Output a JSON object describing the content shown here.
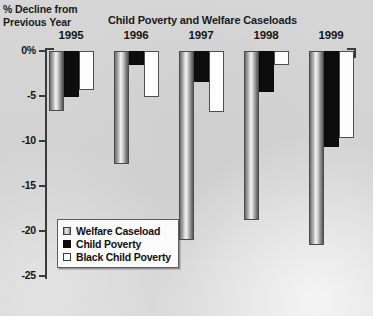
{
  "chart_data": {
    "type": "bar",
    "title": "Child Poverty and Welfare Caseloads",
    "ylabel": "% Decline from Previous Year",
    "xlabel": "",
    "categories": [
      "1995",
      "1996",
      "1997",
      "1998",
      "1999"
    ],
    "ylim": [
      -25,
      0
    ],
    "ytick_labels": [
      "0%",
      "-5",
      "-10",
      "-15",
      "-20",
      "-25"
    ],
    "ytick_values": [
      0,
      -5,
      -10,
      -15,
      -20,
      -25
    ],
    "grid": false,
    "legend_position": "inside-lower-left",
    "series": [
      {
        "name": "Welfare Caseload",
        "color": "#b0b0b0",
        "fill": "gradient-gray",
        "values": [
          -6.7,
          -12.6,
          -21.0,
          -18.8,
          -21.5
        ]
      },
      {
        "name": "Child Poverty",
        "color": "#0d0d0d",
        "fill": "solid-black",
        "values": [
          -5.1,
          -1.5,
          -3.4,
          -4.5,
          -10.7
        ]
      },
      {
        "name": "Black Child Poverty",
        "color": "#ffffff",
        "fill": "white-outlined",
        "values": [
          -4.3,
          -5.1,
          -6.8,
          -1.5,
          -9.7
        ]
      }
    ]
  },
  "colors": {
    "background": "#d4d4d4",
    "axis": "#3a3a3a",
    "text": "#141414",
    "legend_background": "#fbfbfb"
  }
}
